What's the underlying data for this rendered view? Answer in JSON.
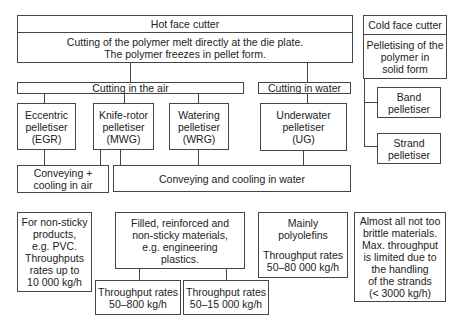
{
  "hot_face_cutter": {
    "title": "Hot face cutter",
    "description": "Cutting of the polymer melt directly at the die plate.\nThe polymer freezes in pellet form."
  },
  "cold_face_cutter": {
    "title": "Cold face cutter",
    "description": "Pelletising of the\npolymer in\nsolid form",
    "children": [
      {
        "label": "Band\npelletiser"
      },
      {
        "label": "Strand\npelletiser"
      }
    ]
  },
  "cutting_in_air": {
    "label": "Cutting in the air",
    "pelletisers": [
      {
        "label": "Eccentric\npelletiser\n(EGR)"
      },
      {
        "label": "Knife-rotor\npelletiser\n(MWG)"
      },
      {
        "label": "Watering\npelletiser\n(WRG)"
      }
    ]
  },
  "cutting_in_water": {
    "label": "Cutting in water",
    "pelletisers": [
      {
        "label": "Underwater\npelletiser\n(UG)"
      }
    ]
  },
  "conveying": {
    "air": "Conveying +\ncooling in air",
    "water": "Conveying and  cooling in water"
  },
  "applications": {
    "non_sticky": "For non-sticky\nproducts,\ne.g. PVC.\nThroughputs\nrates up to\n10 000 kg/h",
    "filled": "Filled, reinforced and\nnon-sticky materials,\ne.g. engineering\nplastics.",
    "throughput_mwg": "Throughput rates\n50–800 kg/h",
    "throughput_wrg": "Throughput rates\n50–15 000 kg/h",
    "polyolefins_title": "Mainly\npolyolefins",
    "polyolefins_throughput": "Throughput rates\n50–80 000 kg/h",
    "strand_materials": "Almost all not too\nbrittle materials.\nMax. throughput\nis limited due to\nthe handling\nof the strands\n(< 3000 kg/h)"
  },
  "colors": {
    "line": "#444444",
    "background": "#ffffff",
    "text": "#222222"
  }
}
